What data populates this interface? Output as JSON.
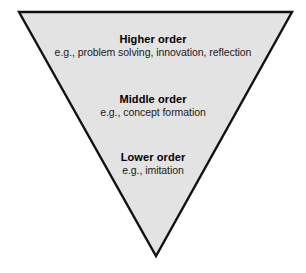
{
  "diagram": {
    "type": "inverted-triangle-hierarchy",
    "shape_name": "inverted-triangle",
    "colors": {
      "fill": "#e3e3e3",
      "stroke": "#111111",
      "background": "#ffffff",
      "text": "#000000"
    },
    "geometry": {
      "top_left": [
        19,
        12
      ],
      "top_right": [
        292,
        12
      ],
      "apex": [
        156,
        256
      ],
      "stroke_width": 2.4
    },
    "tiers": [
      {
        "id": "higher",
        "title": "Higher order",
        "subtitle": "e.g., problem solving, innovation, reflection"
      },
      {
        "id": "middle",
        "title": "Middle order",
        "subtitle": "e.g., concept formation"
      },
      {
        "id": "lower",
        "title": "Lower order",
        "subtitle": "e.g., imitation"
      }
    ]
  }
}
